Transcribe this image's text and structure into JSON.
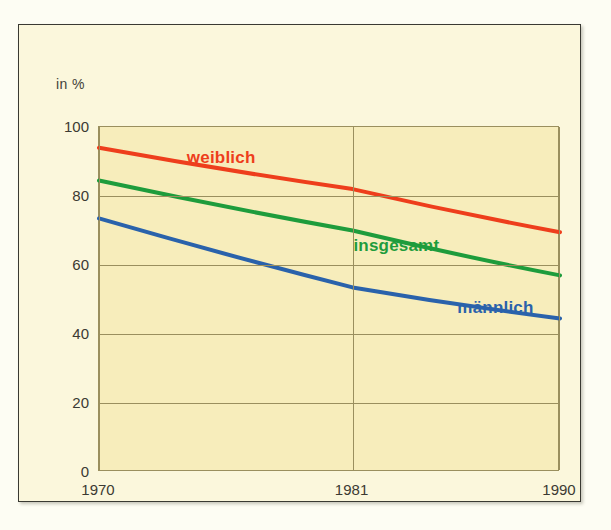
{
  "figure": {
    "axis_unit_label": "in %",
    "background_color": "#fbf7dc",
    "plot_background_color": "#f7edbb",
    "grid_color": "#9a8f5e",
    "border_color": "#3a3a32"
  },
  "chart_data": {
    "type": "line",
    "title": "",
    "subtitle": "",
    "xlabel": "",
    "ylabel": "in %",
    "ylim": [
      0,
      100
    ],
    "xlim": [
      1970,
      1990
    ],
    "grid": true,
    "legend_position": "inline-labels",
    "x": [
      1970,
      1981,
      1990
    ],
    "categories": [
      "1970",
      "1981",
      "1990"
    ],
    "xticks": [
      "1970",
      "1981",
      "1990"
    ],
    "yticks": [
      "0",
      "20",
      "40",
      "60",
      "80",
      "100"
    ],
    "ytick_values": [
      0,
      20,
      40,
      60,
      80,
      100
    ],
    "series": [
      {
        "name": "weiblich",
        "color": "#ee3e1c",
        "values": [
          94,
          82,
          69.5
        ],
        "label_x": 1975.3,
        "label_y": 91
      },
      {
        "name": "insgesamt",
        "color": "#1e9c3c",
        "values": [
          84.5,
          70,
          57
        ],
        "label_x": 1982.9,
        "label_y": 65.5
      },
      {
        "name": "männlich",
        "color": "#2a62ab",
        "values": [
          73.5,
          53.5,
          44.5
        ],
        "label_x": 1987.2,
        "label_y": 47.5
      }
    ]
  }
}
